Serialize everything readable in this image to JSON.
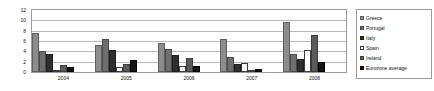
{
  "chart_data": {
    "type": "bar",
    "title": "",
    "xlabel": "",
    "ylabel": "",
    "categories": [
      "2004",
      "2005",
      "2006",
      "2007",
      "2008"
    ],
    "ylim": [
      0,
      12
    ],
    "yticks": [
      0,
      2,
      4,
      6,
      8,
      10,
      12
    ],
    "grid": true,
    "legend_position": "right",
    "series": [
      {
        "name": "Greece",
        "color": "#8c8c8c",
        "values": [
          7.5,
          5.2,
          5.7,
          6.4,
          9.6
        ]
      },
      {
        "name": "Portugal",
        "color": "#6e6e6e",
        "values": [
          4.0,
          6.4,
          4.4,
          2.9,
          3.4
        ]
      },
      {
        "name": "Italy",
        "color": "#2e2e2e",
        "values": [
          3.5,
          4.3,
          3.3,
          1.6,
          2.6
        ]
      },
      {
        "name": "Spain",
        "color": "#ffffff",
        "values": [
          0.1,
          1.0,
          1.1,
          1.8,
          4.3
        ]
      },
      {
        "name": "Ireland",
        "color": "#5a5a5a",
        "values": [
          1.3,
          1.6,
          2.7,
          0.1,
          7.1
        ]
      },
      {
        "name": "Eurozone average",
        "color": "#141414",
        "values": [
          1.0,
          2.4,
          1.2,
          0.6,
          1.9
        ]
      }
    ]
  }
}
